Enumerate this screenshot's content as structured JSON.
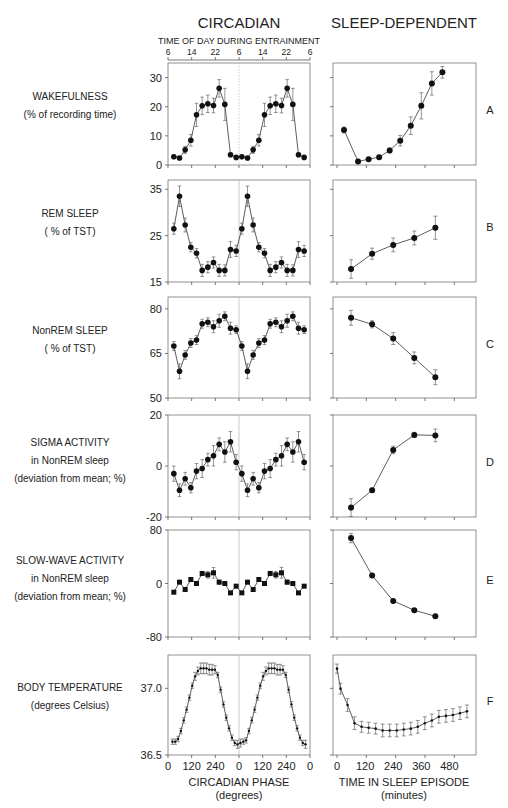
{
  "headers": {
    "circadian": "CIRCADIAN",
    "sleep_dependent": "SLEEP-DEPENDENT",
    "top_axis_label": "TIME OF DAY DURING ENTRAINMENT",
    "top_axis_ticks": [
      "6",
      "14",
      "22",
      "6",
      "14",
      "22",
      "6"
    ]
  },
  "x_axes": {
    "left": {
      "ticks": [
        "0",
        "120",
        "240",
        "0",
        "120",
        "240",
        "0"
      ],
      "label1": "CIRCADIAN PHASE",
      "label2": "(degrees)"
    },
    "right": {
      "ticks": [
        "0",
        "120",
        "240",
        "360",
        "480"
      ],
      "label1": "TIME IN SLEEP EPISODE",
      "label2": "(minutes)"
    }
  },
  "chart_data": [
    {
      "panel": "A",
      "type": "line",
      "row_label": [
        "WAKEFULNESS",
        "(% of recording time)"
      ],
      "yticks": [
        0,
        10,
        20,
        30
      ],
      "ylim": [
        0,
        35
      ],
      "circadian": {
        "y": [
          2.8,
          2.4,
          5.2,
          8.5,
          17.2,
          20.3,
          21,
          20.4,
          26.3,
          20.8,
          3.5,
          2.6,
          2.8,
          2.4,
          5.2,
          8.5,
          17.2,
          20.3,
          21,
          20.4,
          26.3,
          20.8,
          3.5,
          2.6
        ],
        "err": [
          0.5,
          0.5,
          1.2,
          2,
          4,
          3,
          3,
          2.5,
          3,
          5.5,
          0.6,
          0.5,
          0.5,
          0.5,
          1.2,
          2,
          4,
          3,
          3,
          2.5,
          3,
          5.5,
          0.6,
          0.5
        ]
      },
      "sleep": {
        "x": [
          30,
          90,
          135,
          180,
          225,
          270,
          315,
          360,
          405,
          450
        ],
        "y": [
          12,
          1.2,
          2,
          2.7,
          5,
          8.3,
          13.5,
          20.3,
          28,
          31.8
        ],
        "err": [
          1,
          0.4,
          0.5,
          0.5,
          0.8,
          1.8,
          3,
          4.5,
          4,
          2
        ]
      }
    },
    {
      "panel": "B",
      "type": "line",
      "row_label": [
        "REM SLEEP",
        "( % of TST)"
      ],
      "yticks": [
        15,
        25,
        35
      ],
      "ylim": [
        15,
        37
      ],
      "circadian": {
        "y": [
          26.5,
          33.5,
          27.3,
          22.5,
          21.2,
          17.5,
          18.2,
          19.2,
          17.5,
          17.5,
          22,
          21.7,
          26.5,
          33.5,
          27.3,
          22.5,
          21.2,
          17.5,
          18.2,
          19.2,
          17.5,
          17.5,
          22,
          21.7
        ],
        "err": [
          1.2,
          2.2,
          1.5,
          1,
          1,
          1.3,
          1.2,
          1.2,
          1.3,
          1.2,
          1.7,
          1.2,
          1.2,
          2.2,
          1.5,
          1,
          1,
          1.3,
          1.2,
          1.2,
          1.3,
          1.2,
          1.7,
          1.2
        ]
      },
      "sleep": {
        "x": [
          60,
          150,
          240,
          330,
          420
        ],
        "y": [
          17.8,
          21.1,
          23,
          24.5,
          26.7
        ],
        "err": [
          2,
          1.2,
          1.5,
          1.5,
          2.5
        ]
      }
    },
    {
      "panel": "C",
      "type": "line",
      "row_label": [
        "NonREM SLEEP",
        "( % of TST)"
      ],
      "yticks": [
        50,
        65,
        80
      ],
      "ylim": [
        50,
        84
      ],
      "circadian": {
        "y": [
          67.5,
          59,
          64.5,
          68.5,
          69.5,
          75,
          75.5,
          74,
          76,
          77.5,
          73.5,
          73,
          67.5,
          59,
          64.5,
          68.5,
          69.5,
          75,
          75.5,
          74,
          76,
          77.5,
          73.5,
          73
        ],
        "err": [
          1.5,
          2.5,
          1.5,
          1.5,
          1.5,
          1.5,
          1.5,
          2,
          2.2,
          1.5,
          2,
          1.3,
          1.5,
          2.5,
          1.5,
          1.5,
          1.5,
          1.5,
          1.5,
          2,
          2.2,
          1.5,
          2,
          1.3
        ]
      },
      "sleep": {
        "x": [
          60,
          150,
          240,
          330,
          420
        ],
        "y": [
          77,
          74.8,
          70,
          63.5,
          57
        ],
        "err": [
          2.5,
          1.2,
          2,
          2,
          2.5
        ]
      }
    },
    {
      "panel": "D",
      "type": "line",
      "row_label": [
        "SIGMA ACTIVITY",
        "in NonREM sleep",
        "(deviation from mean; %)"
      ],
      "yticks": [
        -20,
        0,
        20
      ],
      "ylim": [
        -20,
        20
      ],
      "circadian": {
        "y": [
          -3,
          -9.5,
          -5,
          -8.5,
          -2,
          -1,
          2.5,
          4,
          8.5,
          5.5,
          9.5,
          1.5,
          -3,
          -9.5,
          -5,
          -8.5,
          -2,
          -1,
          2.5,
          4,
          8.5,
          5.5,
          9.5,
          1.5
        ],
        "err": [
          3,
          2.5,
          2.5,
          2,
          3,
          3.5,
          2.5,
          4,
          2.5,
          4,
          4,
          3,
          3,
          2.5,
          2.5,
          2,
          3,
          3.5,
          2.5,
          4,
          2.5,
          4,
          4,
          3
        ]
      },
      "sleep": {
        "x": [
          60,
          150,
          240,
          330,
          420
        ],
        "y": [
          -16.3,
          -9.5,
          6.3,
          12.2,
          12
        ],
        "err": [
          3.5,
          0.8,
          1.5,
          1,
          2.5
        ]
      }
    },
    {
      "panel": "E",
      "type": "line",
      "row_label": [
        "SLOW-WAVE ACTIVITY",
        "in NonREM sleep",
        "(deviation from mean; %)"
      ],
      "yticks": [
        -80,
        0,
        80
      ],
      "ylim": [
        -80,
        80
      ],
      "circadian": {
        "y": [
          -13,
          2,
          -9,
          6,
          0,
          15,
          13,
          16,
          2,
          0,
          -14,
          -4,
          -14,
          2,
          -9,
          6,
          0,
          15,
          13,
          16,
          2,
          0,
          -14,
          -4
        ],
        "err": [
          2,
          2,
          2,
          2,
          2,
          3,
          5,
          8,
          3,
          3,
          2,
          2,
          2,
          2,
          2,
          2,
          2,
          3,
          5,
          8,
          3,
          3,
          2,
          2
        ]
      },
      "sleep": {
        "x": [
          60,
          150,
          240,
          330,
          420
        ],
        "y": [
          68,
          12,
          -26,
          -40,
          -49
        ],
        "err": [
          7,
          2,
          2,
          2,
          2
        ]
      }
    },
    {
      "panel": "F",
      "type": "line",
      "row_label": [
        "BODY TEMPERATURE",
        "(degrees Celsius)"
      ],
      "yticks": [
        36.5,
        37.0
      ],
      "ylim": [
        36.5,
        37.25
      ],
      "circadian": {
        "y": [
          36.6,
          36.6,
          36.62,
          36.68,
          36.76,
          36.84,
          36.93,
          37.02,
          37.09,
          37.13,
          37.15,
          37.15,
          37.15,
          37.14,
          37.14,
          37.14,
          37.1,
          36.99,
          36.88,
          36.78,
          36.7,
          36.63,
          36.59,
          36.58,
          36.59,
          36.6,
          36.61,
          36.68,
          36.76,
          36.84,
          36.93,
          37.02,
          37.09,
          37.13,
          37.15,
          37.15,
          37.15,
          37.14,
          37.14,
          37.14,
          37.1,
          36.99,
          36.88,
          36.78,
          36.7,
          36.63,
          36.59,
          36.58
        ],
        "err": [
          0.02,
          0.02,
          0.02,
          0.02,
          0.02,
          0.02,
          0.02,
          0.02,
          0.03,
          0.03,
          0.04,
          0.04,
          0.04,
          0.04,
          0.04,
          0.03,
          0.02,
          0.02,
          0.02,
          0.02,
          0.02,
          0.02,
          0.02,
          0.03,
          0.03,
          0.02,
          0.02,
          0.02,
          0.02,
          0.02,
          0.02,
          0.02,
          0.03,
          0.03,
          0.04,
          0.04,
          0.04,
          0.04,
          0.04,
          0.03,
          0.02,
          0.02,
          0.02,
          0.02,
          0.02,
          0.02,
          0.02,
          0.03
        ]
      },
      "sleep": {
        "x": [
          0,
          15,
          45,
          75,
          105,
          135,
          165,
          195,
          225,
          255,
          285,
          315,
          345,
          375,
          405,
          435,
          465,
          495,
          525,
          555
        ],
        "y": [
          36.95,
          36.73,
          36.55,
          36.35,
          36.31,
          36.3,
          36.29,
          36.27,
          36.27,
          36.27,
          36.28,
          36.29,
          36.31,
          36.35,
          36.38,
          36.42,
          36.43,
          36.44,
          36.46,
          36.48
        ],
        "err": [
          0.05,
          0.06,
          0.07,
          0.07,
          0.06,
          0.06,
          0.06,
          0.07,
          0.07,
          0.07,
          0.07,
          0.07,
          0.07,
          0.07,
          0.07,
          0.07,
          0.07,
          0.07,
          0.07,
          0.07
        ]
      }
    }
  ]
}
